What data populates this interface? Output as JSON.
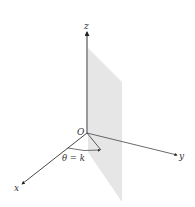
{
  "diagram": {
    "axes": {
      "z": {
        "label": "z"
      },
      "y": {
        "label": "y"
      },
      "x": {
        "label": "x"
      }
    },
    "origin_label": "O",
    "angle_label": "θ = k",
    "colors": {
      "plane_fill": "#e6e6e6",
      "axis": "#333333",
      "background": "#ffffff"
    }
  }
}
